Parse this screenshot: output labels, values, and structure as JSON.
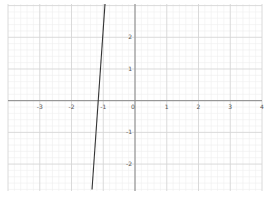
{
  "chart_data": {
    "type": "line",
    "title": "",
    "xlabel": "",
    "ylabel": "",
    "xlim": [
      -4,
      4
    ],
    "ylim": [
      -2.85,
      3.05
    ],
    "grid": true,
    "grid_major_step": 1,
    "grid_minor_step": 0.2,
    "x_tick_labels": [
      "-3",
      "-2",
      "-1",
      "0",
      "1",
      "2",
      "3",
      "4"
    ],
    "x_ticks": [
      -3,
      -2,
      -1,
      0,
      1,
      2,
      3,
      4
    ],
    "y_tick_labels": [
      "2",
      "1",
      "0",
      "-1",
      "-2"
    ],
    "y_ticks": [
      2,
      1,
      0,
      -1,
      -2
    ],
    "series": [
      {
        "name": "line",
        "color": "#333333",
        "x": [
          -0.945,
          -1.354
        ],
        "y": [
          3.05,
          -2.8
        ]
      }
    ],
    "legend": null
  },
  "colors": {
    "background": "#ffffff",
    "minor_grid": "#eeeeee",
    "major_grid": "#d6d6d6",
    "axis": "#8a8a8a",
    "line": "#333333",
    "label": "#555555"
  }
}
